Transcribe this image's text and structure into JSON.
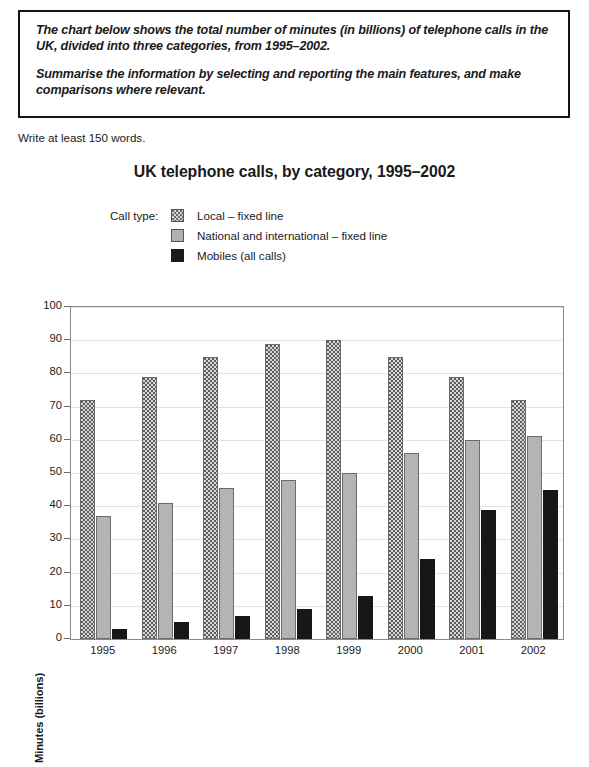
{
  "prompt": {
    "paragraphs": [
      "The chart below shows the total number of minutes (in billions) of telephone calls in the UK, divided into three categories, from 1995–2002.",
      "Summarise the information by selecting and reporting the main features, and make comparisons where relevant."
    ]
  },
  "word_count_note": "Write at least 150 words.",
  "legend": {
    "title": "Call type:"
  },
  "colors": {
    "local": "#d8d8d8",
    "national": "#b4b4b4",
    "mobiles": "#171717",
    "frame": "#8a8a8a",
    "grid": "#e2e2e2",
    "text": "#1a1a1a"
  },
  "chart_data": {
    "type": "bar",
    "title": "UK telephone calls, by category, 1995–2002",
    "xlabel": "",
    "ylabel": "Minutes (billions)",
    "ylim": [
      0,
      100
    ],
    "yticks": [
      0,
      10,
      20,
      30,
      40,
      50,
      60,
      70,
      80,
      90,
      100
    ],
    "grid": true,
    "legend_position": "above-plot-left",
    "categories": [
      "1995",
      "1996",
      "1997",
      "1998",
      "1999",
      "2000",
      "2001",
      "2002"
    ],
    "series": [
      {
        "name": "Local – fixed line",
        "key": "local",
        "values": [
          72,
          79,
          85,
          89,
          90,
          85,
          79,
          72
        ]
      },
      {
        "name": "National and international – fixed line",
        "key": "national",
        "values": [
          37,
          41,
          45.5,
          48,
          50,
          56,
          60,
          61
        ]
      },
      {
        "name": "Mobiles (all calls)",
        "key": "mobiles",
        "values": [
          3,
          5,
          7,
          9,
          13,
          24,
          39,
          45
        ]
      }
    ]
  }
}
